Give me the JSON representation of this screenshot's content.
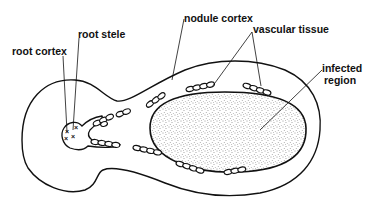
{
  "diagram": {
    "type": "labeled biological cross-section",
    "labels": {
      "root_cortex": "root cortex",
      "root_stele": "root stele",
      "nodule_cortex": "nodule cortex",
      "vascular_tissue": "vascular tissue",
      "infected_region_line1": "infected",
      "infected_region_line2": "region"
    },
    "structures": [
      {
        "name": "root cortex",
        "description": "outer tissue of the root (left lobe)"
      },
      {
        "name": "root stele",
        "description": "central vascular cylinder marked with x symbols (xylem)"
      },
      {
        "name": "nodule cortex",
        "description": "outer tissue layer of the nodule"
      },
      {
        "name": "vascular tissue",
        "description": "vascular bundles arranged around infected region"
      },
      {
        "name": "infected region",
        "description": "stippled central zone of the nodule"
      }
    ],
    "colors": {
      "line": "#111111",
      "background": "#ffffff",
      "stipple": "#333333"
    }
  }
}
